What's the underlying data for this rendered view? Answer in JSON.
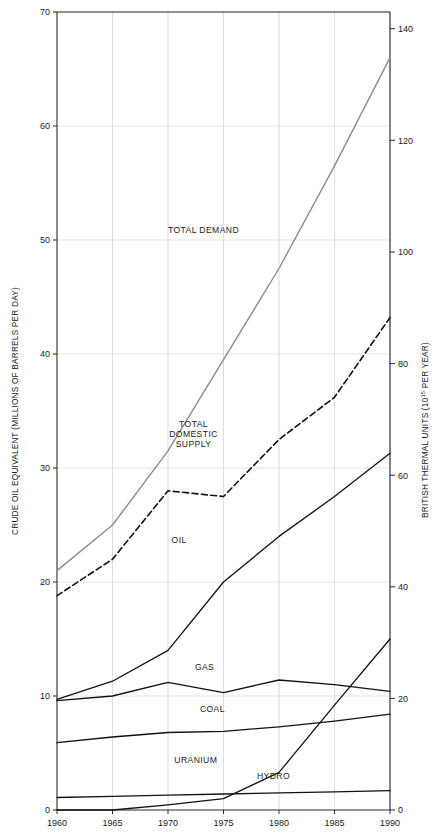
{
  "chart_data": {
    "type": "line",
    "title": "",
    "xlabel": "",
    "ylabel": "CRUDE OIL EQUIVALENT (MILLIONS OF BARRELS PER DAY)",
    "y2label": "BRITISH THERMAL UNITS (10",
    "y2label_exp": "15",
    "y2label_tail": " PER YEAR)",
    "x": [
      1960,
      1965,
      1970,
      1975,
      1980,
      1985,
      1990
    ],
    "xticklabels": [
      "1960",
      "1965",
      "1970",
      "1975",
      "1980",
      "1985",
      "1990"
    ],
    "xlim": [
      1960,
      1990
    ],
    "ylim": [
      0,
      70
    ],
    "yticks": [
      0,
      10,
      20,
      30,
      40,
      50,
      60,
      70
    ],
    "yticklabels": [
      "0",
      "10",
      "20",
      "30",
      "40",
      "50",
      "60",
      "70"
    ],
    "y2lim": [
      0,
      143
    ],
    "y2ticks": [
      0,
      20,
      40,
      60,
      80,
      100,
      120,
      140
    ],
    "y2ticklabels": [
      "0",
      "20",
      "40",
      "60",
      "80",
      "100",
      "120",
      "140"
    ],
    "grid": true,
    "legend_position": "inline-annotations",
    "series": [
      {
        "name": "TOTAL DEMAND",
        "style": "solid",
        "color": "#8c8c8c",
        "width": 1.4,
        "values": [
          21.0,
          25.0,
          31.5,
          39.5,
          47.5,
          56.5,
          66.0
        ],
        "label_x": 1973.2,
        "label_y": 50.6
      },
      {
        "name": "TOTAL DOMESTIC SUPPLY",
        "label_lines": [
          "TOTAL",
          "DOMESTIC",
          "SUPPLY"
        ],
        "style": "dashed",
        "color": "#111111",
        "width": 1.6,
        "values": [
          18.8,
          22.0,
          28.0,
          27.5,
          32.5,
          36.2,
          43.2
        ],
        "label_x": 1972.3,
        "label_y": 33.6
      },
      {
        "name": "OIL",
        "style": "solid",
        "color": "#111111",
        "width": 1.3,
        "values": [
          9.7,
          11.3,
          14.0,
          20.0,
          24.0,
          27.5,
          31.3
        ],
        "label_x": 1971.0,
        "label_y": 23.4
      },
      {
        "name": "GAS",
        "style": "solid",
        "color": "#111111",
        "width": 1.3,
        "values": [
          9.6,
          10.0,
          11.2,
          10.3,
          11.4,
          11.0,
          10.4
        ],
        "label_x": 1973.3,
        "label_y": 12.3
      },
      {
        "name": "COAL",
        "style": "solid",
        "color": "#111111",
        "width": 1.3,
        "values": [
          5.9,
          6.4,
          6.8,
          6.9,
          7.3,
          7.8,
          8.4
        ],
        "label_x": 1974.0,
        "label_y": 8.6
      },
      {
        "name": "URANIUM",
        "style": "solid",
        "color": "#111111",
        "width": 1.3,
        "values": [
          0.0,
          0.0,
          0.45,
          1.0,
          3.3,
          9.2,
          15.0
        ],
        "label_x": 1972.5,
        "label_y": 4.1
      },
      {
        "name": "HYDRO",
        "style": "solid",
        "color": "#111111",
        "width": 1.3,
        "values": [
          1.1,
          1.2,
          1.3,
          1.4,
          1.5,
          1.6,
          1.7
        ],
        "label_x": 1979.5,
        "label_y": 2.7
      }
    ]
  }
}
